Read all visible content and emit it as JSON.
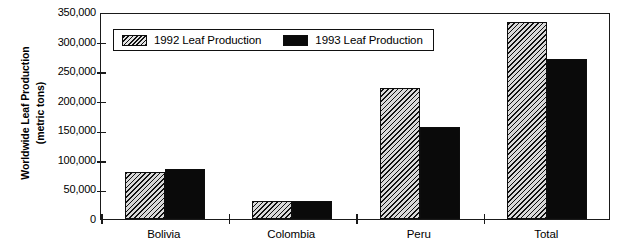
{
  "chart_data": {
    "type": "bar",
    "title": "",
    "xlabel": "",
    "ylabel": "Worldwide Leaf Production (metric tons)",
    "ylabel_lines": [
      "Worldwide Leaf Production",
      "(metric tons)"
    ],
    "categories": [
      "Bolivia",
      "Colombia",
      "Peru",
      "Total"
    ],
    "series": [
      {
        "name": "1992 Leaf Production",
        "values": [
          80000,
          30000,
          222000,
          333000
        ],
        "fill": "diagonal-hatch",
        "color": "#d9d9d9"
      },
      {
        "name": "1993 Leaf Production",
        "values": [
          85000,
          31000,
          155000,
          270000
        ],
        "fill": "solid",
        "color": "#0a0a0a"
      }
    ],
    "ylim": [
      0,
      350000
    ],
    "ytick_values": [
      0,
      50000,
      100000,
      150000,
      200000,
      250000,
      300000,
      350000
    ],
    "ytick_labels": [
      "0",
      "50,000",
      "100,000",
      "150,000",
      "200,000",
      "250,000",
      "300,000",
      "350,000"
    ],
    "grid": false,
    "legend_position": "upper-left-inside",
    "frame": true
  },
  "legend": {
    "entries": [
      {
        "label": "1992 Leaf Production",
        "swatch": "hatched-swatch"
      },
      {
        "label": "1993 Leaf Production",
        "swatch": "solid-black-swatch"
      }
    ]
  }
}
